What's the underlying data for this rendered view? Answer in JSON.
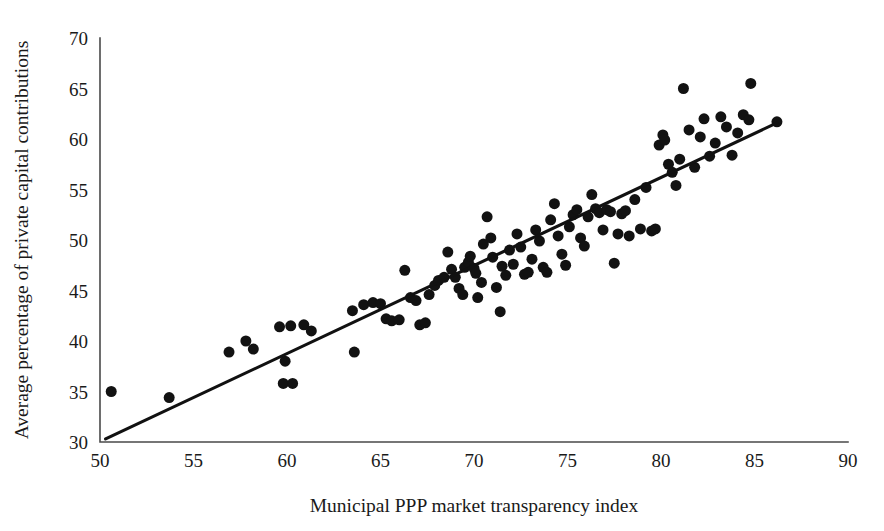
{
  "chart_data": {
    "type": "scatter",
    "title": "",
    "xlabel": "Municipal PPP market transparency index",
    "ylabel": "Average percentage of private capital contributions",
    "xlim": [
      50,
      90
    ],
    "ylim": [
      30,
      70
    ],
    "xticks": [
      50,
      55,
      60,
      65,
      70,
      75,
      80,
      85,
      90
    ],
    "yticks": [
      30,
      35,
      40,
      45,
      50,
      55,
      60,
      65,
      70
    ],
    "xtick_labels": [
      "50",
      "55",
      "60",
      "65",
      "70",
      "75",
      "80",
      "85",
      "90"
    ],
    "ytick_labels": [
      "30",
      "35",
      "40",
      "45",
      "50",
      "55",
      "60",
      "65",
      "70"
    ],
    "grid": false,
    "legend": null,
    "marker_color": "#121212",
    "marker_shape": "circle",
    "marker_size_px": 11,
    "series": [
      {
        "name": "Municipalities",
        "points": [
          [
            50.6,
            35.0
          ],
          [
            53.7,
            34.4
          ],
          [
            56.9,
            38.9
          ],
          [
            57.8,
            40.0
          ],
          [
            58.2,
            39.2
          ],
          [
            59.6,
            41.4
          ],
          [
            60.2,
            41.5
          ],
          [
            60.9,
            41.6
          ],
          [
            61.3,
            41.0
          ],
          [
            59.9,
            38.0
          ],
          [
            59.8,
            35.8
          ],
          [
            60.3,
            35.8
          ],
          [
            63.6,
            38.9
          ],
          [
            63.5,
            43.0
          ],
          [
            64.1,
            43.6
          ],
          [
            64.6,
            43.8
          ],
          [
            65.0,
            43.7
          ],
          [
            65.3,
            42.2
          ],
          [
            65.6,
            42.0
          ],
          [
            66.0,
            42.1
          ],
          [
            66.3,
            47.0
          ],
          [
            66.6,
            44.3
          ],
          [
            66.9,
            44.0
          ],
          [
            67.1,
            41.6
          ],
          [
            67.4,
            41.8
          ],
          [
            67.6,
            44.6
          ],
          [
            67.9,
            45.5
          ],
          [
            68.1,
            46.0
          ],
          [
            68.4,
            46.3
          ],
          [
            68.6,
            48.8
          ],
          [
            68.8,
            47.1
          ],
          [
            69.0,
            46.3
          ],
          [
            69.2,
            45.2
          ],
          [
            69.4,
            44.6
          ],
          [
            69.5,
            47.3
          ],
          [
            69.7,
            47.8
          ],
          [
            69.8,
            48.4
          ],
          [
            70.0,
            47.2
          ],
          [
            70.1,
            46.7
          ],
          [
            70.2,
            44.3
          ],
          [
            70.4,
            45.8
          ],
          [
            70.5,
            49.6
          ],
          [
            70.7,
            52.3
          ],
          [
            70.9,
            50.2
          ],
          [
            71.0,
            48.3
          ],
          [
            71.2,
            45.3
          ],
          [
            71.4,
            42.9
          ],
          [
            71.5,
            47.4
          ],
          [
            71.7,
            46.5
          ],
          [
            71.9,
            49.0
          ],
          [
            72.1,
            47.6
          ],
          [
            72.3,
            50.6
          ],
          [
            72.5,
            49.3
          ],
          [
            72.7,
            46.6
          ],
          [
            72.9,
            46.8
          ],
          [
            73.1,
            48.1
          ],
          [
            73.3,
            51.0
          ],
          [
            73.5,
            49.9
          ],
          [
            73.7,
            47.3
          ],
          [
            73.9,
            46.8
          ],
          [
            74.1,
            52.0
          ],
          [
            74.3,
            53.6
          ],
          [
            74.5,
            50.4
          ],
          [
            74.7,
            48.6
          ],
          [
            74.9,
            47.5
          ],
          [
            75.1,
            51.3
          ],
          [
            75.3,
            52.5
          ],
          [
            75.5,
            53.0
          ],
          [
            75.7,
            50.2
          ],
          [
            75.9,
            49.4
          ],
          [
            76.1,
            52.3
          ],
          [
            76.3,
            54.5
          ],
          [
            76.5,
            53.1
          ],
          [
            76.7,
            52.7
          ],
          [
            76.9,
            51.0
          ],
          [
            77.1,
            53.0
          ],
          [
            77.3,
            52.8
          ],
          [
            77.5,
            47.7
          ],
          [
            77.7,
            50.6
          ],
          [
            77.9,
            52.6
          ],
          [
            78.1,
            52.9
          ],
          [
            78.3,
            50.4
          ],
          [
            78.6,
            54.0
          ],
          [
            78.9,
            51.1
          ],
          [
            79.2,
            55.2
          ],
          [
            79.5,
            50.9
          ],
          [
            79.7,
            51.1
          ],
          [
            79.9,
            59.4
          ],
          [
            80.1,
            60.4
          ],
          [
            80.2,
            59.9
          ],
          [
            80.4,
            57.5
          ],
          [
            80.6,
            56.7
          ],
          [
            80.8,
            55.4
          ],
          [
            81.0,
            58.0
          ],
          [
            81.2,
            65.0
          ],
          [
            81.5,
            60.9
          ],
          [
            81.8,
            57.2
          ],
          [
            82.1,
            60.2
          ],
          [
            82.3,
            62.0
          ],
          [
            82.6,
            58.3
          ],
          [
            82.9,
            59.6
          ],
          [
            83.2,
            62.2
          ],
          [
            83.5,
            61.2
          ],
          [
            83.8,
            58.4
          ],
          [
            84.1,
            60.6
          ],
          [
            84.4,
            62.4
          ],
          [
            84.7,
            61.9
          ],
          [
            84.8,
            65.5
          ],
          [
            86.2,
            61.7
          ]
        ]
      }
    ],
    "trend_line": {
      "name": "linear fit",
      "x_start": 50.3,
      "y_start": 30.3,
      "x_end": 86.2,
      "y_end": 61.6,
      "color": "#111111"
    }
  }
}
